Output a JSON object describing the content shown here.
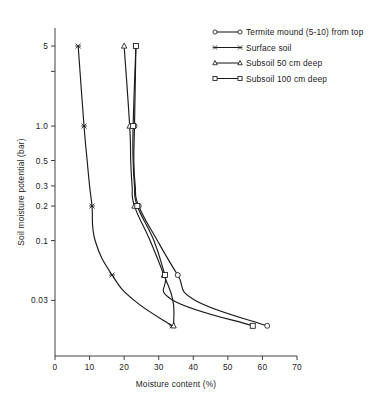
{
  "chart_data": {
    "type": "line",
    "title": "",
    "xlabel": "Moisture content (%)",
    "ylabel": "Soil moisture potential (bar)",
    "xlim": [
      0,
      70
    ],
    "xticks": [
      0,
      10,
      20,
      30,
      40,
      50,
      60,
      70
    ],
    "xticklabels": [
      "0",
      "10",
      "20",
      "30",
      "40",
      "50",
      "60",
      "70"
    ],
    "yscale": "log-inverted",
    "ylim": [
      5.0,
      0.018
    ],
    "yticks": [
      5.0,
      3.0,
      1.0,
      0.5,
      0.3,
      0.2,
      0.1,
      0.03
    ],
    "yticklabels": [
      "5",
      "",
      "1.0",
      "0.5",
      "0.3",
      "0.2",
      "0.1",
      "0.03"
    ],
    "grid": false,
    "legend_position": "top-right",
    "series": [
      {
        "name": "Termite mound (5-10) from top",
        "marker": "circle",
        "points": [
          {
            "y": 5.0,
            "x": 23.4
          },
          {
            "y": 1.0,
            "x": 23.0
          },
          {
            "y": 0.5,
            "x": 22.8
          },
          {
            "y": 0.3,
            "x": 23.2
          },
          {
            "y": 0.2,
            "x": 24.2
          },
          {
            "y": 0.1,
            "x": 29.6
          },
          {
            "y": 0.05,
            "x": 35.5
          },
          {
            "y": 0.03,
            "x": 40.6
          },
          {
            "y": 0.018,
            "x": 61.4
          }
        ]
      },
      {
        "name": "Surface soil",
        "marker": "star",
        "points": [
          {
            "y": 5.0,
            "x": 6.7
          },
          {
            "y": 1.0,
            "x": 8.4
          },
          {
            "y": 0.5,
            "x": 9.3
          },
          {
            "y": 0.3,
            "x": 10.0
          },
          {
            "y": 0.2,
            "x": 10.7
          },
          {
            "y": 0.1,
            "x": 11.6
          },
          {
            "y": 0.05,
            "x": 16.5
          },
          {
            "y": 0.03,
            "x": 22.9
          },
          {
            "y": 0.018,
            "x": 33.9
          }
        ]
      },
      {
        "name": "Subsoil 50 cm deep",
        "marker": "triangle",
        "points": [
          {
            "y": 5.0,
            "x": 20.0
          },
          {
            "y": 1.0,
            "x": 21.6
          },
          {
            "y": 0.5,
            "x": 21.9
          },
          {
            "y": 0.3,
            "x": 22.3
          },
          {
            "y": 0.2,
            "x": 23.0
          },
          {
            "y": 0.1,
            "x": 27.5
          },
          {
            "y": 0.05,
            "x": 31.5
          },
          {
            "y": 0.03,
            "x": 34.1
          },
          {
            "y": 0.018,
            "x": 34.3
          }
        ]
      },
      {
        "name": "Subsoil 100 cm deep",
        "marker": "square",
        "points": [
          {
            "y": 5.0,
            "x": 23.4
          },
          {
            "y": 1.0,
            "x": 22.6
          },
          {
            "y": 0.5,
            "x": 22.6
          },
          {
            "y": 0.3,
            "x": 23.0
          },
          {
            "y": 0.2,
            "x": 23.8
          },
          {
            "y": 0.1,
            "x": 28.6
          },
          {
            "y": 0.05,
            "x": 31.8
          },
          {
            "y": 0.03,
            "x": 34.2
          },
          {
            "y": 0.018,
            "x": 57.2
          }
        ]
      }
    ]
  },
  "legend": {
    "entries": [
      {
        "label": "Termite mound (5-10) from top",
        "marker": "circle"
      },
      {
        "label": "Surface soil",
        "marker": "star"
      },
      {
        "label": "Subsoil 50 cm deep",
        "marker": "triangle"
      },
      {
        "label": "Subsoil 100 cm deep",
        "marker": "square"
      }
    ]
  }
}
